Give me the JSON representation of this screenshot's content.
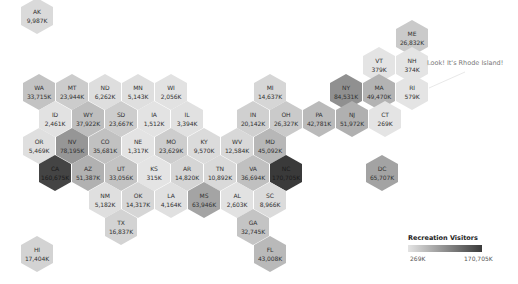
{
  "chart_data": {
    "type": "heatmap",
    "subtype": "hex-tile-map",
    "title": "",
    "legend": {
      "title": "Recreation Visitors",
      "min_label": "269K",
      "max_label": "170,705K",
      "min": 269,
      "max": 170705,
      "unit": "K",
      "color_low": "#e4e4e4",
      "color_high": "#3a3a3a",
      "position": "bottom-right"
    },
    "annotation": "Look! It's Rhode Island!",
    "states": [
      {
        "abbr": "AK",
        "label": "9,987K",
        "value": 9987,
        "x": 37,
        "y": 16
      },
      {
        "abbr": "ME",
        "label": "26,832K",
        "value": 26832,
        "x": 412,
        "y": 38
      },
      {
        "abbr": "VT",
        "label": "379K",
        "value": 379,
        "x": 379,
        "y": 65
      },
      {
        "abbr": "NH",
        "label": "374K",
        "value": 374,
        "x": 412,
        "y": 65
      },
      {
        "abbr": "WA",
        "label": "33,715K",
        "value": 33715,
        "x": 39,
        "y": 92
      },
      {
        "abbr": "MT",
        "label": "23,944K",
        "value": 23944,
        "x": 72,
        "y": 92
      },
      {
        "abbr": "ND",
        "label": "6,262K",
        "value": 6262,
        "x": 105,
        "y": 92
      },
      {
        "abbr": "MN",
        "label": "5,143K",
        "value": 5143,
        "x": 138,
        "y": 92
      },
      {
        "abbr": "WI",
        "label": "2,056K",
        "value": 2056,
        "x": 171,
        "y": 92
      },
      {
        "abbr": "MI",
        "label": "14,637K",
        "value": 14637,
        "x": 270,
        "y": 92
      },
      {
        "abbr": "NY",
        "label": "84,531K",
        "value": 84531,
        "x": 346,
        "y": 92
      },
      {
        "abbr": "MA",
        "label": "49,470K",
        "value": 49470,
        "x": 379,
        "y": 92
      },
      {
        "abbr": "RI",
        "label": "579K",
        "value": 579,
        "x": 412,
        "y": 92
      },
      {
        "abbr": "ID",
        "label": "2,461K",
        "value": 2461,
        "x": 55,
        "y": 119
      },
      {
        "abbr": "WY",
        "label": "37,922K",
        "value": 37922,
        "x": 88,
        "y": 119
      },
      {
        "abbr": "SD",
        "label": "23,667K",
        "value": 23667,
        "x": 121,
        "y": 119
      },
      {
        "abbr": "IA",
        "label": "1,512K",
        "value": 1512,
        "x": 154,
        "y": 119
      },
      {
        "abbr": "IL",
        "label": "3,394K",
        "value": 3394,
        "x": 187,
        "y": 119
      },
      {
        "abbr": "IN",
        "label": "20,142K",
        "value": 20142,
        "x": 253,
        "y": 119
      },
      {
        "abbr": "OH",
        "label": "26,327K",
        "value": 26327,
        "x": 286,
        "y": 119
      },
      {
        "abbr": "PA",
        "label": "42,781K",
        "value": 42781,
        "x": 319,
        "y": 119
      },
      {
        "abbr": "NJ",
        "label": "51,972K",
        "value": 51972,
        "x": 352,
        "y": 119
      },
      {
        "abbr": "CT",
        "label": "269K",
        "value": 269,
        "x": 385,
        "y": 119
      },
      {
        "abbr": "OR",
        "label": "5,469K",
        "value": 5469,
        "x": 39,
        "y": 146
      },
      {
        "abbr": "NV",
        "label": "78,195K",
        "value": 78195,
        "x": 72,
        "y": 146
      },
      {
        "abbr": "CO",
        "label": "35,681K",
        "value": 35681,
        "x": 105,
        "y": 146
      },
      {
        "abbr": "NE",
        "label": "1,317K",
        "value": 1317,
        "x": 138,
        "y": 146
      },
      {
        "abbr": "MO",
        "label": "23,629K",
        "value": 23629,
        "x": 171,
        "y": 146
      },
      {
        "abbr": "KY",
        "label": "9,570K",
        "value": 9570,
        "x": 204,
        "y": 146
      },
      {
        "abbr": "WV",
        "label": "12,584K",
        "value": 12584,
        "x": 237,
        "y": 146
      },
      {
        "abbr": "MD",
        "label": "45,092K",
        "value": 45092,
        "x": 270,
        "y": 146
      },
      {
        "abbr": "CA",
        "label": "160,675K",
        "value": 160675,
        "x": 55,
        "y": 173
      },
      {
        "abbr": "AZ",
        "label": "51,387K",
        "value": 51387,
        "x": 88,
        "y": 173
      },
      {
        "abbr": "UT",
        "label": "33,056K",
        "value": 33056,
        "x": 121,
        "y": 173
      },
      {
        "abbr": "KS",
        "label": "315K",
        "value": 315,
        "x": 154,
        "y": 173
      },
      {
        "abbr": "AR",
        "label": "14,820K",
        "value": 14820,
        "x": 187,
        "y": 173
      },
      {
        "abbr": "TN",
        "label": "10,892K",
        "value": 10892,
        "x": 220,
        "y": 173
      },
      {
        "abbr": "VA",
        "label": "36,694K",
        "value": 36694,
        "x": 253,
        "y": 173
      },
      {
        "abbr": "NC",
        "label": "170,705K",
        "value": 170705,
        "x": 286,
        "y": 173
      },
      {
        "abbr": "DC",
        "label": "65,707K",
        "value": 65707,
        "x": 382,
        "y": 173
      },
      {
        "abbr": "NM",
        "label": "5,182K",
        "value": 5182,
        "x": 105,
        "y": 200
      },
      {
        "abbr": "OK",
        "label": "14,317K",
        "value": 14317,
        "x": 138,
        "y": 200
      },
      {
        "abbr": "LA",
        "label": "4,164K",
        "value": 4164,
        "x": 171,
        "y": 200
      },
      {
        "abbr": "MS",
        "label": "63,946K",
        "value": 63946,
        "x": 204,
        "y": 200
      },
      {
        "abbr": "AL",
        "label": "2,603K",
        "value": 2603,
        "x": 237,
        "y": 200
      },
      {
        "abbr": "SC",
        "label": "8,966K",
        "value": 8966,
        "x": 270,
        "y": 200
      },
      {
        "abbr": "TX",
        "label": "16,837K",
        "value": 16837,
        "x": 121,
        "y": 227
      },
      {
        "abbr": "GA",
        "label": "32,745K",
        "value": 32745,
        "x": 253,
        "y": 227
      },
      {
        "abbr": "FL",
        "label": "43,008K",
        "value": 43008,
        "x": 270,
        "y": 254
      },
      {
        "abbr": "HI",
        "label": "17,404K",
        "value": 17404,
        "x": 37,
        "y": 254
      }
    ]
  }
}
